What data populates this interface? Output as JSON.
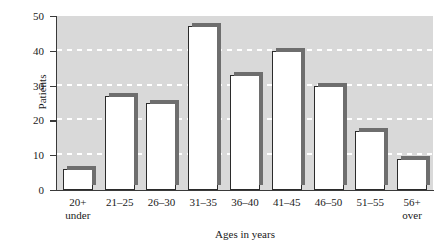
{
  "chart_data": {
    "type": "bar",
    "title": "",
    "xlabel": "Ages in years",
    "ylabel": "Patients",
    "categories": [
      "20+ under",
      "21–25",
      "26–30",
      "31–35",
      "36–40",
      "41–45",
      "46–50",
      "51–55",
      "56+ over"
    ],
    "category_lines": [
      [
        "20+",
        "under"
      ],
      [
        "21–25",
        ""
      ],
      [
        "26–30",
        ""
      ],
      [
        "31–35",
        ""
      ],
      [
        "36–40",
        ""
      ],
      [
        "41–45",
        ""
      ],
      [
        "46–50",
        ""
      ],
      [
        "51–55",
        ""
      ],
      [
        "56+",
        "over"
      ]
    ],
    "values": [
      6,
      27,
      25,
      47,
      33,
      40,
      30,
      17,
      9
    ],
    "ylim": [
      0,
      50
    ],
    "yticks": [
      0,
      10,
      20,
      30,
      40,
      50
    ],
    "ytick_labels": [
      "0",
      "10",
      "20",
      "30",
      "40",
      "50"
    ],
    "grid": true,
    "gridlines_at": [
      10,
      20,
      30,
      40
    ],
    "legend": "none",
    "colors": {
      "plot_background": "#d9d9d9",
      "gridline": "#ffffff",
      "bar_fill": "#ffffff",
      "bar_outline": "#2b2b2b",
      "bar_shadow": "#6e6e6e",
      "axis": "#3a3a3a",
      "text": "#1a1a1a",
      "page_background": "#ffffff"
    }
  }
}
